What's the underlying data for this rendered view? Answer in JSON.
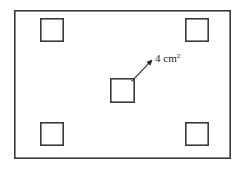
{
  "figure": {
    "background_color": "#ffffff",
    "stroke_color": "#3a3a3a",
    "text_color": "#1a1a1a",
    "outer_rectangle": {
      "name": "outer-rectangle",
      "x": 14,
      "y": 10,
      "width": 217,
      "height": 149,
      "stroke_width": 1.6
    },
    "squares": [
      {
        "name": "square-top-left",
        "x": 40,
        "y": 18,
        "size": 24,
        "stroke_width": 1.6
      },
      {
        "name": "square-top-right",
        "x": 185,
        "y": 18,
        "size": 24,
        "stroke_width": 1.6
      },
      {
        "name": "square-center",
        "x": 110,
        "y": 78,
        "size": 25,
        "stroke_width": 1.6
      },
      {
        "name": "square-bottom-left",
        "x": 40,
        "y": 122,
        "size": 24,
        "stroke_width": 1.6
      },
      {
        "name": "square-bottom-right",
        "x": 185,
        "y": 122,
        "size": 24,
        "stroke_width": 1.6
      }
    ],
    "arrow": {
      "name": "area-callout-arrow",
      "from_x": 132,
      "from_y": 81,
      "to_x": 152,
      "to_y": 60,
      "stroke_width": 1.1,
      "head_size": 5
    },
    "annotation": {
      "name": "area-label",
      "value": "4 cm",
      "exponent": "2",
      "full_text": "4 cm2",
      "x": 155,
      "y": 62,
      "font_size": 11
    }
  }
}
